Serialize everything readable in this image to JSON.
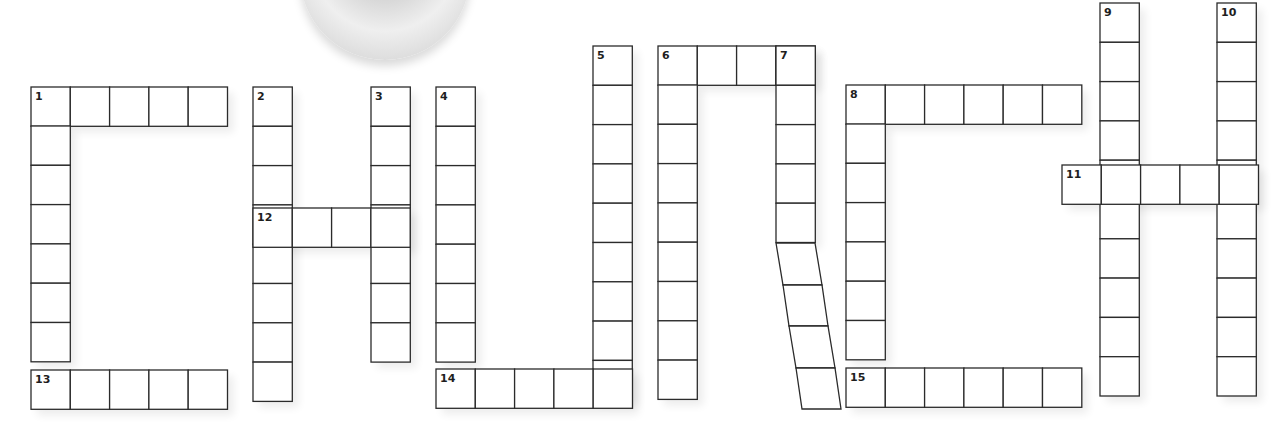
{
  "colors": {
    "background": "#ffffff",
    "cell_fill": "#ffffff",
    "cell_border": "#2b2b2b",
    "number": "#1e1e1e"
  },
  "ornament": {
    "shape": "gray-disc",
    "partially_visible": true
  },
  "cell_size": 39.3,
  "clues": [
    {
      "number": "1",
      "direction": "across",
      "length": 5
    },
    {
      "number": "2",
      "direction": "down",
      "length": 8
    },
    {
      "number": "3",
      "direction": "down",
      "length": 7
    },
    {
      "number": "4",
      "direction": "down",
      "length": 8
    },
    {
      "number": "5",
      "direction": "down",
      "length": 9
    },
    {
      "number": "6",
      "direction": "across",
      "length": 4
    },
    {
      "number": "6",
      "direction": "down",
      "length": 9
    },
    {
      "number": "7",
      "direction": "down",
      "length": 9
    },
    {
      "number": "8",
      "direction": "across",
      "length": 6
    },
    {
      "number": "8",
      "direction": "down",
      "length": 8
    },
    {
      "number": "9",
      "direction": "down",
      "length": 10
    },
    {
      "number": "10",
      "direction": "down",
      "length": 10
    },
    {
      "number": "11",
      "direction": "across",
      "length": 5
    },
    {
      "number": "12",
      "direction": "across",
      "length": 4
    },
    {
      "number": "13",
      "direction": "across",
      "length": 5
    },
    {
      "number": "14",
      "direction": "across",
      "length": 5
    },
    {
      "number": "15",
      "direction": "across",
      "length": 6
    }
  ],
  "rects": [
    {
      "x": 31,
      "y": 87,
      "w": 5,
      "h": 1,
      "label": "1"
    },
    {
      "x": 31,
      "y": 126,
      "w": 1,
      "h": 6
    },
    {
      "x": 31,
      "y": 370,
      "w": 5,
      "h": 1,
      "label": "13"
    },
    {
      "x": 253,
      "y": 87,
      "w": 1,
      "h": 8,
      "label": "2"
    },
    {
      "x": 371,
      "y": 87,
      "w": 1,
      "h": 7,
      "label": "3"
    },
    {
      "x": 253,
      "y": 208,
      "w": 4,
      "h": 1,
      "label": "12"
    },
    {
      "x": 436,
      "y": 87,
      "w": 1,
      "h": 7,
      "label": "4"
    },
    {
      "x": 593,
      "y": 46,
      "w": 1,
      "h": 9,
      "label": "5"
    },
    {
      "x": 436,
      "y": 369,
      "w": 5,
      "h": 1,
      "label": "14"
    },
    {
      "x": 658,
      "y": 46,
      "w": 4,
      "h": 1,
      "label": "6"
    },
    {
      "x": 658,
      "y": 85,
      "w": 1,
      "h": 8
    },
    {
      "x": 776,
      "y": 46,
      "w": 1,
      "h": 5,
      "label": "7"
    },
    {
      "x": 846,
      "y": 85,
      "w": 6,
      "h": 1,
      "label": "8"
    },
    {
      "x": 846,
      "y": 124,
      "w": 1,
      "h": 6
    },
    {
      "x": 846,
      "y": 368,
      "w": 6,
      "h": 1,
      "label": "15"
    },
    {
      "x": 1100,
      "y": 3,
      "w": 1,
      "h": 10,
      "label": "9"
    },
    {
      "x": 1217,
      "y": 3,
      "w": 1,
      "h": 10,
      "label": "10"
    },
    {
      "x": 1062,
      "y": 165,
      "w": 5,
      "h": 1,
      "label": "11"
    }
  ],
  "slanted": [
    {
      "pts": "776,243 815,243 822,285 783,285"
    },
    {
      "pts": "783,285 822,285 828,326 789,326"
    },
    {
      "pts": "789,326 828,326 835,368 796,368"
    },
    {
      "pts": "796,368 835,368 841,409 802,409"
    }
  ]
}
